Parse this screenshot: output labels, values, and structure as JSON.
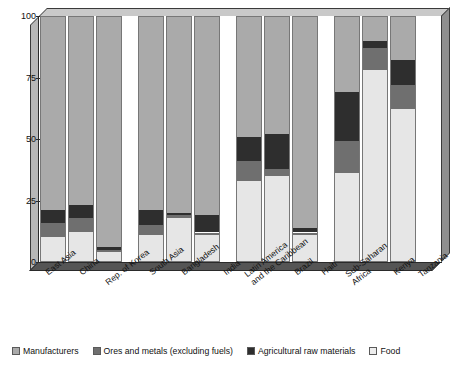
{
  "chart_data": {
    "type": "bar",
    "subtype": "stacked-percentage-column",
    "title": "",
    "xlabel": "",
    "ylabel": "",
    "ylim": [
      0,
      100
    ],
    "yticks": [
      0,
      25,
      50,
      75,
      100
    ],
    "grid": false,
    "legend_position": "bottom",
    "stack_order_bottom_to_top": [
      "Food",
      "Ores and metals (excluding fuels)",
      "Agricultural raw materials",
      "Manufacturers"
    ],
    "categories": [
      "East Asia",
      "China",
      "Rep. of Korea",
      "South Asia",
      "Bangladesh",
      "India",
      "Latin America and the Caribbean",
      "Brazil",
      "Haiti",
      "Sub-Saharan Africa",
      "Kenya",
      "Tanzania"
    ],
    "series": [
      {
        "name": "Food",
        "color": "#e6e6e6",
        "values": [
          10,
          12,
          4,
          11,
          18,
          11,
          33,
          35,
          11,
          36,
          78,
          62
        ]
      },
      {
        "name": "Ores and metals (excluding fuels)",
        "color": "#6f6f6f",
        "values": [
          6,
          6,
          1,
          4,
          1,
          1,
          8,
          3,
          1,
          13,
          9,
          10
        ]
      },
      {
        "name": "Agricultural raw materials",
        "color": "#2e2e2e",
        "values": [
          5,
          5,
          1,
          6,
          1,
          7,
          10,
          14,
          2,
          20,
          3,
          10
        ]
      },
      {
        "name": "Manufacturers",
        "color": "#aaaaaa",
        "values": [
          79,
          77,
          94,
          79,
          80,
          81,
          49,
          48,
          86,
          31,
          10,
          18
        ]
      }
    ],
    "legend": [
      {
        "label": "Manufacturers",
        "color": "#aaaaaa"
      },
      {
        "label": "Ores and metals (excluding fuels)",
        "color": "#6f6f6f"
      },
      {
        "label": "Agricultural raw materials",
        "color": "#2e2e2e"
      },
      {
        "label": "Food",
        "color": "#ededed"
      }
    ]
  },
  "axis": {
    "yticks": [
      "100",
      "75",
      "50",
      "25",
      "0"
    ]
  },
  "xlabels": [
    {
      "lines": [
        "East Asia"
      ],
      "x": 44,
      "y": 8
    },
    {
      "lines": [
        "China"
      ],
      "x": 78,
      "y": 8
    },
    {
      "lines": [
        "Rep. of Korea"
      ],
      "x": 104,
      "y": 18
    },
    {
      "lines": [
        "South Asia"
      ],
      "x": 148,
      "y": 8
    },
    {
      "lines": [
        "Bangladesh"
      ],
      "x": 180,
      "y": 8
    },
    {
      "lines": [
        "India"
      ],
      "x": 222,
      "y": 8
    },
    {
      "lines": [
        "Latin America",
        "and the Caribbean"
      ],
      "x": 243,
      "y": 10
    },
    {
      "lines": [
        "Brazil"
      ],
      "x": 293,
      "y": 8
    },
    {
      "lines": [
        "Haiti"
      ],
      "x": 320,
      "y": 8
    },
    {
      "lines": [
        "Sub-Saharan",
        "Africa"
      ],
      "x": 344,
      "y": 10
    },
    {
      "lines": [
        "Kenya"
      ],
      "x": 392,
      "y": 8
    },
    {
      "lines": [
        "Tanzania"
      ],
      "x": 417,
      "y": 10
    }
  ],
  "bars": [
    {
      "name": "east-asia",
      "x": 40,
      "w": 26
    },
    {
      "name": "china",
      "x": 68,
      "w": 26
    },
    {
      "name": "rep-of-korea",
      "x": 96,
      "w": 26
    },
    {
      "name": "south-asia",
      "x": 138,
      "w": 26
    },
    {
      "name": "bangladesh",
      "x": 166,
      "w": 26
    },
    {
      "name": "india",
      "x": 194,
      "w": 26
    },
    {
      "name": "latin-america",
      "x": 236,
      "w": 26
    },
    {
      "name": "brazil",
      "x": 264,
      "w": 26
    },
    {
      "name": "haiti",
      "x": 292,
      "w": 26
    },
    {
      "name": "sub-saharan-africa",
      "x": 334,
      "w": 26
    },
    {
      "name": "kenya",
      "x": 362,
      "w": 26
    },
    {
      "name": "tanzania",
      "x": 390,
      "w": 26
    }
  ]
}
